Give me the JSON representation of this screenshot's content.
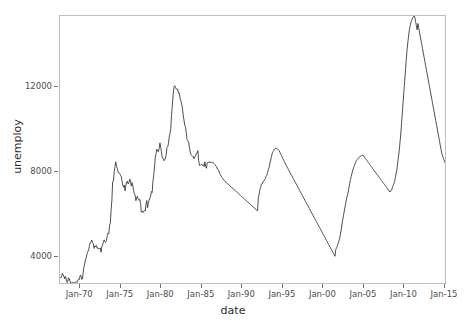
{
  "chart_data": {
    "type": "line",
    "title": "",
    "xlabel": "date",
    "ylabel": "unemploy",
    "grid": false,
    "legend": "none",
    "line_color": "#3b3b3b",
    "panel_border_color": "#bdbdbd",
    "axis_text_color": "#4d4d4d",
    "xlim": [
      "1967-07-01",
      "2015-04-01"
    ],
    "ylim": [
      2685,
      15352
    ],
    "y_ticks": [
      4000,
      8000,
      12000
    ],
    "y_tick_labels": [
      "4000",
      "8000",
      "12000"
    ],
    "x_ticks": [
      "1970-01-01",
      "1975-01-01",
      "1980-01-01",
      "1985-01-01",
      "1990-01-01",
      "1995-01-01",
      "2000-01-01",
      "2005-01-01",
      "2010-01-01",
      "2015-01-01"
    ],
    "x_tick_labels": [
      "Jan-70",
      "Jan-75",
      "Jan-80",
      "Jan-85",
      "Jan-90",
      "Jan-95",
      "Jan-00",
      "Jan-05",
      "Jan-10",
      "Jan-15"
    ],
    "series": [
      {
        "name": "unemploy",
        "x_start_year": 1967.5,
        "x_step_years": 0.0833333,
        "values": [
          2944,
          2945,
          2958,
          3143,
          3066,
          3018,
          2878,
          3001,
          2877,
          2709,
          2740,
          2938,
          2883,
          2768,
          2686,
          2689,
          2715,
          2685,
          2718,
          2692,
          2712,
          2758,
          2713,
          2816,
          2868,
          2856,
          3040,
          3049,
          2856,
          2884,
          3201,
          3453,
          3635,
          3797,
          3919,
          4071,
          4175,
          4256,
          4456,
          4591,
          4617,
          4725,
          4602,
          4543,
          4326,
          4452,
          4394,
          4459,
          4329,
          4363,
          4305,
          4305,
          4350,
          4144,
          4396,
          4489,
          4644,
          4731,
          4634,
          4618,
          4705,
          4927,
          5063,
          5022,
          5437,
          5523,
          6140,
          6636,
          7501,
          7520,
          7978,
          8210,
          8433,
          8220,
          8127,
          7928,
          7923,
          7897,
          7794,
          7744,
          7534,
          7326,
          7230,
          7330,
          7053,
          7322,
          7490,
          7518,
          7380,
          7430,
          7620,
          7545,
          7280,
          7443,
          7307,
          7059,
          6911,
          6856,
          6591,
          6749,
          6803,
          6655,
          6608,
          6656,
          6454,
          6044,
          6096,
          6029,
          6090,
          6140,
          6096,
          6394,
          6601,
          6260,
          6481,
          6612,
          6716,
          6804,
          7028,
          6978,
          7508,
          7810,
          8203,
          8631,
          8821,
          9034,
          8936,
          8906,
          9080,
          9333,
          9107,
          8910,
          8627,
          8607,
          8488,
          8507,
          8593,
          8754,
          9110,
          9149,
          9297,
          9610,
          9774,
          10022,
          10678,
          11113,
          11590,
          11957,
          12046,
          11973,
          11890,
          11864,
          11889,
          11677,
          11692,
          11463,
          11335,
          11180,
          10995,
          10674,
          10419,
          10184,
          10080,
          9832,
          9494,
          9434,
          9372,
          9129,
          8915,
          8769,
          8736,
          8700,
          8692,
          8586,
          8666,
          8722,
          8842,
          8848,
          8967,
          8500,
          8265,
          8259,
          8306,
          8326,
          8257,
          8299,
          8210,
          8433,
          8220,
          8127,
          7928,
          7923,
          7897,
          7794,
          7744,
          7534,
          7326,
          7230,
          7330,
          7053,
          7322,
          7490,
          7518,
          7380,
          7430,
          7620,
          7545,
          7280,
          7443,
          7307,
          7059,
          6911,
          6856,
          6591,
          6749,
          6803,
          6655,
          6608,
          6656,
          6454,
          6044,
          6096,
          6029,
          6090,
          6140,
          6096,
          6394,
          6601,
          6260,
          6481,
          6612,
          6716,
          6804,
          7028,
          6978,
          7508,
          7810,
          8203,
          8631,
          8821,
          9034,
          8936,
          8906,
          9080,
          9333,
          9107,
          8910,
          8627,
          8607,
          8488,
          8507,
          8593,
          8754,
          9110,
          9149,
          9297,
          9610,
          9774,
          10022,
          10678,
          11113,
          11590,
          11957,
          12046,
          11973,
          11890,
          11864
        ]
      }
    ]
  },
  "chart_series_actual": {
    "note": "monthly US unemployment (thousands), Jul 1967 - Apr 2015",
    "values": [
      2944,
      2945,
      2958,
      3143,
      3066,
      3018,
      2878,
      3001,
      2877,
      2709,
      2740,
      2938,
      2883,
      2768,
      2686,
      2689,
      2715,
      2685,
      2718,
      2692,
      2712,
      2758,
      2713,
      2816,
      2868,
      2856,
      3040,
      3049,
      2856,
      2884,
      3201,
      3453,
      3635,
      3797,
      3919,
      4071,
      4175,
      4256,
      4456,
      4591,
      4617,
      4725,
      4602,
      4543,
      4326,
      4452,
      4394,
      4459,
      4329,
      4363,
      4305,
      4305,
      4350,
      4144,
      4396,
      4489,
      4644,
      4731,
      4634,
      4618,
      4705,
      4927,
      5063,
      5022,
      5437,
      5523,
      6140,
      6636,
      7501,
      7520,
      7978,
      8210,
      8433,
      8220,
      8127,
      7928,
      7923,
      7897,
      7794,
      7744,
      7534,
      7326,
      7230,
      7330,
      7053,
      7322,
      7490,
      7518,
      7380,
      7430,
      7620,
      7545,
      7280,
      7443,
      7307,
      7059,
      6911,
      6856,
      6591,
      6749,
      6803,
      6655,
      6608,
      6656,
      6454,
      6044,
      6096,
      6029,
      6090,
      6140,
      6096,
      6394,
      6601,
      6260,
      6481,
      6612,
      6716,
      6804,
      7028,
      6978,
      7508,
      7810,
      8203,
      8631,
      8821,
      9034,
      8936,
      8906,
      9080,
      9333,
      9107,
      8910,
      8627,
      8607,
      8488,
      8507,
      8593,
      8754,
      9110,
      9149,
      9297,
      9610,
      9774,
      10022,
      10678,
      11113,
      11590,
      11957,
      12046,
      11973,
      11890,
      11864,
      11889,
      11677,
      11692,
      11463,
      11335,
      11180,
      10995,
      10674,
      10419,
      10184,
      10080,
      9832,
      9494,
      9434,
      9372,
      9129,
      8915,
      8769,
      8736,
      8700,
      8692,
      8586,
      8666,
      8722,
      8842,
      8848,
      8967,
      8500,
      8265,
      8259,
      8306,
      8326,
      8257,
      8299,
      8210,
      8433,
      8220,
      8127,
      7928,
      7923,
      7897,
      7794,
      7744,
      7534,
      7326
    ]
  },
  "axes": {
    "x_title": "date",
    "y_title": "unemploy"
  }
}
